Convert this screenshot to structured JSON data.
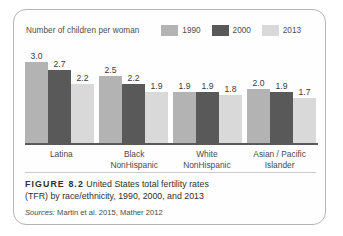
{
  "figure": {
    "number_label": "FIGURE 8.2",
    "caption_line1": " United States total fertility rates",
    "caption_line2": "(TFR) by race/ethnicity, 1990, 2000, and 2013",
    "sources_label": "Sources:",
    "sources_text": " Martin et al. 2015, Mather 2012"
  },
  "legend": {
    "title": "Number of children per woman",
    "entries": [
      {
        "label": "1990",
        "color": "#b3b3b3"
      },
      {
        "label": "2000",
        "color": "#595959"
      },
      {
        "label": "2013",
        "color": "#d9d9d9"
      }
    ]
  },
  "chart_data": {
    "type": "bar",
    "title": "United States total fertility rates (TFR) by race/ethnicity, 1990, 2000, and 2013",
    "xlabel": "",
    "ylabel": "Number of children per woman",
    "ylim": [
      0,
      3.0
    ],
    "grid": false,
    "legend_position": "top-right",
    "categories": [
      "Latina",
      "Black NonHispanic",
      "White NonHispanic",
      "Asian / Pacific Islander"
    ],
    "category_lines": [
      [
        "Latina",
        ""
      ],
      [
        "Black",
        "NonHispanic"
      ],
      [
        "White",
        "NonHispanic"
      ],
      [
        "Asian / Pacific",
        "Islander"
      ]
    ],
    "series": [
      {
        "name": "1990",
        "color": "#b3b3b3",
        "values": [
          3.0,
          2.5,
          1.9,
          2.0
        ]
      },
      {
        "name": "2000",
        "color": "#595959",
        "values": [
          2.7,
          2.2,
          1.9,
          1.9
        ]
      },
      {
        "name": "2013",
        "color": "#d9d9d9",
        "values": [
          2.2,
          1.9,
          1.8,
          1.7
        ]
      }
    ],
    "value_labels": [
      [
        "3.0",
        "2.7",
        "2.2"
      ],
      [
        "2.5",
        "2.2",
        "1.9"
      ],
      [
        "1.9",
        "1.9",
        "1.8"
      ],
      [
        "2.0",
        "1.9",
        "1.7"
      ]
    ]
  }
}
